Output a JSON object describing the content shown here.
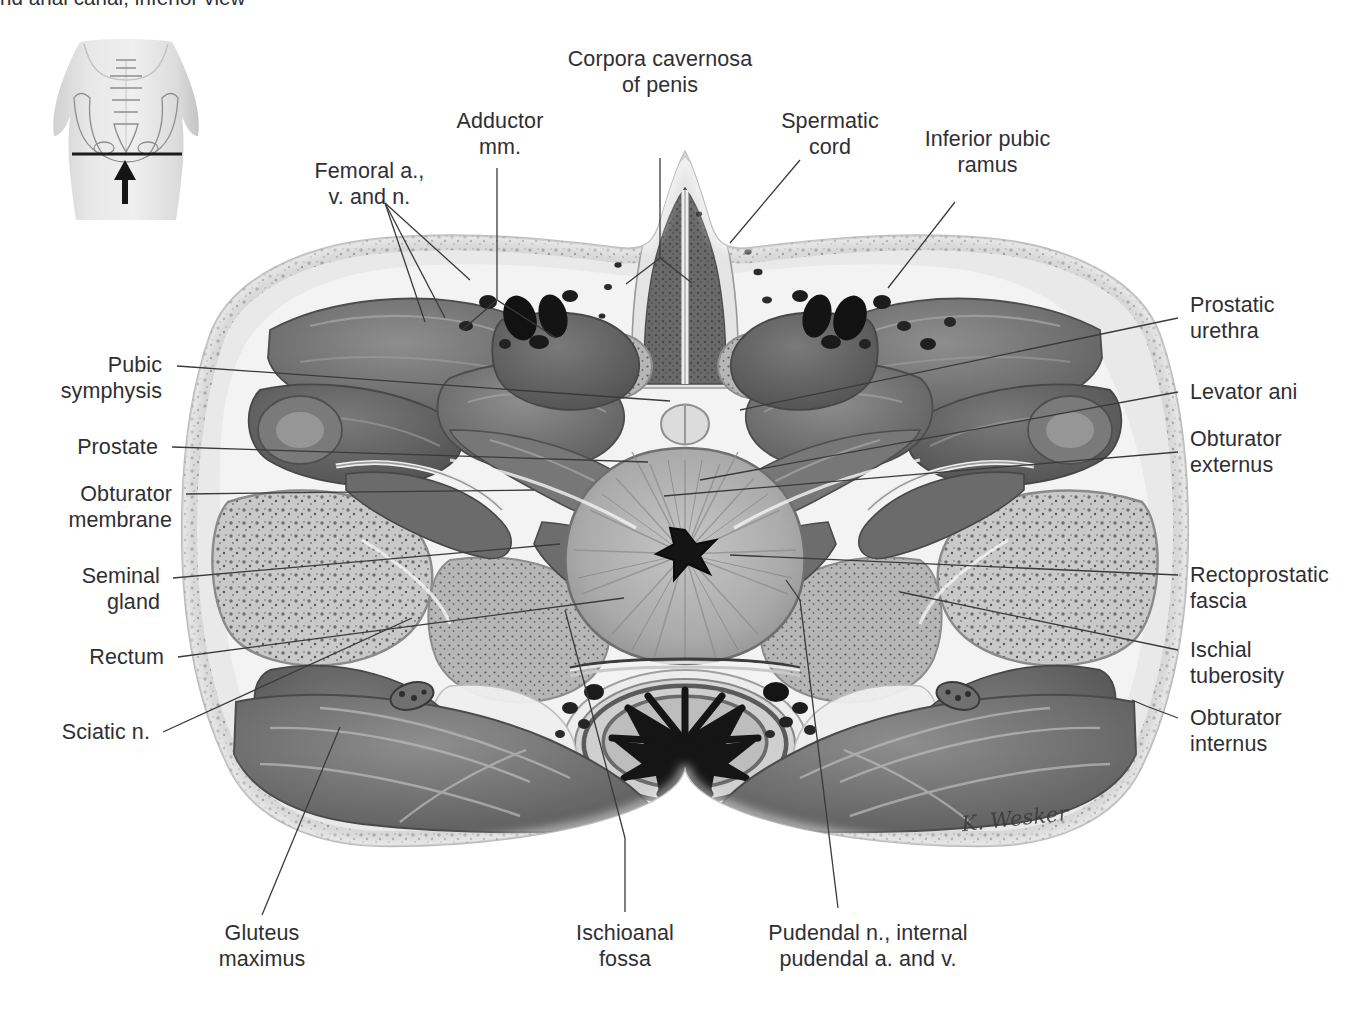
{
  "caption": "nd anal canal, inferior view",
  "artist_signature": "K. Wesker",
  "view": "inferior view",
  "section_plane": "transverse",
  "orientation_thumbnail": {
    "region": "pelvis",
    "section_line": "horizontal",
    "arrow_direction": "up"
  },
  "labels": [
    {
      "id": "corpora-cavernosa-of-penis",
      "text": "Corpora cavernosa\nof penis",
      "side": "top"
    },
    {
      "id": "adductor-mm",
      "text": "Adductor\nmm.",
      "side": "top"
    },
    {
      "id": "spermatic-cord",
      "text": "Spermatic\ncord",
      "side": "top"
    },
    {
      "id": "inferior-pubic-ramus",
      "text": "Inferior pubic\nramus",
      "side": "top"
    },
    {
      "id": "femoral-a-v-and-n",
      "text": "Femoral a.,\nv. and n.",
      "side": "top"
    },
    {
      "id": "pubic-symphysis",
      "text": "Pubic\nsymphysis",
      "side": "left"
    },
    {
      "id": "prostate",
      "text": "Prostate",
      "side": "left"
    },
    {
      "id": "obturator-membrane",
      "text": "Obturator\nmembrane",
      "side": "left"
    },
    {
      "id": "seminal-gland",
      "text": "Seminal\ngland",
      "side": "left"
    },
    {
      "id": "rectum",
      "text": "Rectum",
      "side": "left"
    },
    {
      "id": "sciatic-n",
      "text": "Sciatic n.",
      "side": "left"
    },
    {
      "id": "prostatic-urethra",
      "text": "Prostatic\nurethra",
      "side": "right"
    },
    {
      "id": "levator-ani",
      "text": "Levator ani",
      "side": "right"
    },
    {
      "id": "obturator-externus",
      "text": "Obturator\nexternus",
      "side": "right"
    },
    {
      "id": "rectoprostatic-fascia",
      "text": "Rectoprostatic\nfascia",
      "side": "right"
    },
    {
      "id": "ischial-tuberosity",
      "text": "Ischial\ntuberosity",
      "side": "right"
    },
    {
      "id": "obturator-internus",
      "text": "Obturator\ninternus",
      "side": "right"
    },
    {
      "id": "gluteus-maximus",
      "text": "Gluteus\nmaximus",
      "side": "bottom"
    },
    {
      "id": "ischioanal-fossa",
      "text": "Ischioanal\nfossa",
      "side": "bottom"
    },
    {
      "id": "pudendal-nerve-vessels",
      "text": "Pudendal n., internal\npudendal a. and v.",
      "side": "bottom"
    }
  ],
  "colors": {
    "text": "#2f2f33",
    "leader_line": "#3a3a3c",
    "background": "#ffffff",
    "muscle_mid": "#6f6f6f",
    "muscle_dark": "#4f4f4f",
    "fat_light": "#e9e9e9",
    "bone_speckle": "#c9c9c9",
    "vessel_black": "#121212",
    "prostate_gray": "#aaaaaa"
  }
}
